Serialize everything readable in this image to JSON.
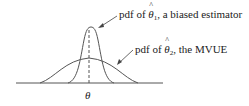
{
  "diagram": {
    "labels": {
      "estimator1": {
        "prefix": "pdf of ",
        "symbol": "θ",
        "subscript": "1",
        "suffix": ", a biased estimator"
      },
      "estimator2": {
        "prefix": "pdf of ",
        "symbol": "θ",
        "subscript": "2",
        "suffix": ", the MVUE"
      }
    },
    "axis_label": "θ",
    "colors": {
      "curve": "#444444",
      "text": "#222222"
    }
  }
}
